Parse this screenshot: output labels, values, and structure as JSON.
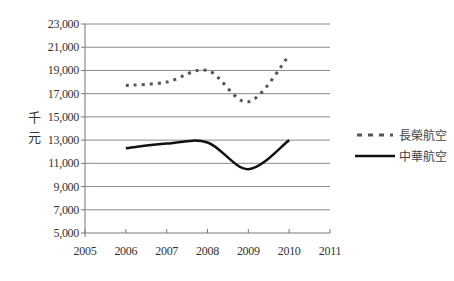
{
  "chart_data": {
    "type": "line",
    "title": "",
    "xlabel": "",
    "ylabel": "千元",
    "x": [
      2006,
      2007,
      2008,
      2009,
      2010
    ],
    "xlim": [
      2005,
      2011
    ],
    "xticks": [
      "2005",
      "2006",
      "2007",
      "2008",
      "2009",
      "2010",
      "2011"
    ],
    "ylim": [
      5000,
      23000
    ],
    "yticks": [
      "5,000",
      "7,000",
      "9,000",
      "11,000",
      "13,000",
      "15,000",
      "17,000",
      "19,000",
      "21,000",
      "23,000"
    ],
    "grid": "horizontal",
    "legend_position": "right",
    "smoothed": true,
    "series": [
      {
        "name": "長榮航空",
        "style": "dashed",
        "color": "#555555",
        "values": [
          17700,
          18000,
          19000,
          16300,
          20300
        ]
      },
      {
        "name": "中華航空",
        "style": "solid",
        "color": "#111111",
        "values": [
          12300,
          12700,
          12800,
          10500,
          13000
        ]
      }
    ]
  },
  "axis": {
    "ylabel_chars": [
      "千",
      "元"
    ]
  },
  "legend": {
    "items": [
      {
        "label": "長榮航空",
        "style": "dashed"
      },
      {
        "label": "中華航空",
        "style": "solid"
      }
    ]
  }
}
